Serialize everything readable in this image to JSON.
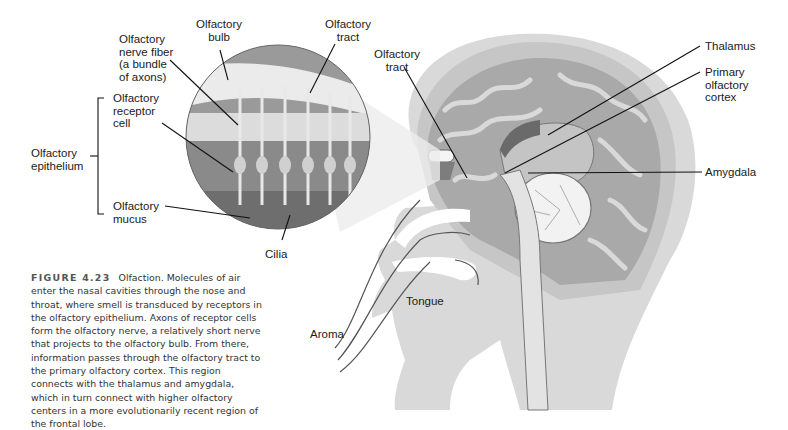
{
  "figure": {
    "number": "FIGURE 4.23",
    "caption": "Olfaction. Molecules of air enter the nasal cavities through the nose and throat, where smell is transduced by receptors in the olfactory epithelium. Axons of receptor cells form the olfactory nerve, a relatively short nerve that projects to the olfactory bulb. From there, information passes through the olfactory tract to the primary olfactory cortex. This region connects with the thalamus and amygdala, which in turn connect with higher olfactory centers in a more evolutionarily recent region of the frontal lobe."
  },
  "labels": {
    "olfactory_bulb": "Olfactory\nbulb",
    "olfactory_tract_inset": "Olfactory\ntract",
    "olfactory_nerve_fiber": "Olfactory\nnerve fiber\n(a bundle\nof axons)",
    "olfactory_tract_brain": "Olfactory\ntract",
    "olfactory_receptor_cell": "Olfactory\nreceptor\ncell",
    "olfactory_epithelium": "Olfactory\nepithelium",
    "olfactory_mucus": "Olfactory\nmucus",
    "cilia": "Cilia",
    "thalamus": "Thalamus",
    "primary_olfactory_cortex": "Primary\nolfactory\ncortex",
    "amygdala": "Amygdala",
    "tongue": "Tongue",
    "aroma": "Aroma"
  },
  "colors": {
    "tissue_light": "#d6d6d6",
    "tissue_mid": "#b5b5b5",
    "tissue_dark": "#8e8e8e",
    "leader_line": "#111111"
  }
}
